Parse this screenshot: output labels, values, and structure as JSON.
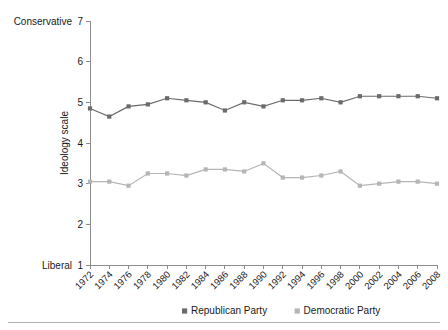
{
  "chart_data": {
    "type": "line",
    "title": "",
    "xlabel": "",
    "ylabel": "Ideology scale",
    "ylim": [
      1,
      7
    ],
    "yticks": [
      1,
      2,
      3,
      4,
      5,
      6,
      7
    ],
    "y_axis_endpoint_labels": {
      "high": "Conservative",
      "low": "Liberal"
    },
    "grid": false,
    "legend_position": "bottom-center",
    "categories": [
      "1972",
      "1974",
      "1976",
      "1978",
      "1980",
      "1982",
      "1984",
      "1986",
      "1988",
      "1990",
      "1992",
      "1994",
      "1996",
      "1998",
      "2000",
      "2002",
      "2004",
      "2006",
      "2008"
    ],
    "series": [
      {
        "name": "Republican Party",
        "color": "#6b6b6b",
        "marker": "square",
        "values": [
          4.85,
          4.65,
          4.9,
          4.95,
          5.1,
          5.05,
          5.0,
          4.8,
          5.0,
          4.9,
          5.05,
          5.05,
          5.1,
          5.0,
          5.15,
          5.15,
          5.15,
          5.15,
          5.1
        ]
      },
      {
        "name": "Democratic Party",
        "color": "#b5b5b5",
        "marker": "square",
        "values": [
          3.05,
          3.05,
          2.95,
          3.25,
          3.25,
          3.2,
          3.35,
          3.35,
          3.3,
          3.5,
          3.15,
          3.15,
          3.2,
          3.3,
          2.95,
          3.0,
          3.05,
          3.05,
          3.0
        ]
      }
    ]
  },
  "legend": {
    "items": [
      {
        "label": "Republican Party",
        "color": "#6b6b6b"
      },
      {
        "label": "Democratic Party",
        "color": "#b5b5b5"
      }
    ]
  },
  "colors": {
    "republican": "#6b6b6b",
    "democratic": "#b5b5b5",
    "axis": "#8c8c8c",
    "text": "#1a1a1a",
    "divider": "#b0b0b0"
  }
}
